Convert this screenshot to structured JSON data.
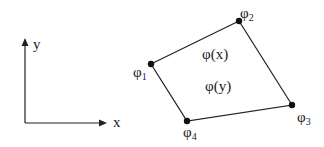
{
  "axes": {
    "x_label": "x",
    "y_label": "y"
  },
  "nodes": [
    {
      "id": 1,
      "symbol": "φ",
      "sub": "1",
      "x": 151,
      "y": 64
    },
    {
      "id": 2,
      "symbol": "φ",
      "sub": "2",
      "x": 239,
      "y": 21
    },
    {
      "id": 3,
      "symbol": "φ",
      "sub": "3",
      "x": 292,
      "y": 105
    },
    {
      "id": 4,
      "symbol": "φ",
      "sub": "4",
      "x": 187,
      "y": 121
    }
  ],
  "interior": {
    "label_x": "φ(x)",
    "label_y": "φ(y)"
  },
  "colors": {
    "stroke": "#222222",
    "background": "#ffffff"
  }
}
